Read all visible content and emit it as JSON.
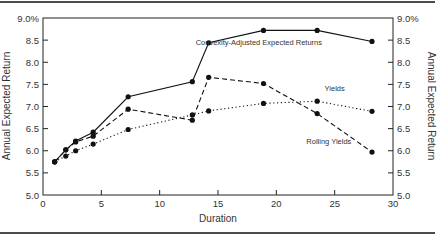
{
  "chart_data": {
    "type": "line",
    "title": "",
    "xlabel": "Duration",
    "ylabel": "Annual Expected Return",
    "ylabel_right": "Annual Expected Return",
    "xlim": [
      0,
      30
    ],
    "ylim": [
      5.0,
      9.0
    ],
    "x_ticks": [
      "0",
      "5",
      "10",
      "15",
      "20",
      "25",
      "30"
    ],
    "y_ticks": [
      "5.0",
      "5.5",
      "6.0",
      "6.5",
      "7.0",
      "7.5",
      "8.0",
      "8.5",
      "9.0%"
    ],
    "grid": false,
    "legend": "inline annotations",
    "series": [
      {
        "name": "Convexity-Adjusted Expected Returns",
        "style": "solid",
        "x": [
          1.0,
          1.95,
          2.8,
          4.3,
          7.3,
          12.8,
          14.2,
          18.9,
          23.5,
          28.2
        ],
        "y": [
          5.75,
          6.02,
          6.22,
          6.42,
          7.22,
          7.56,
          8.44,
          8.72,
          8.72,
          8.47
        ]
      },
      {
        "name": "Rolling Yields",
        "style": "dashed",
        "x": [
          1.0,
          1.95,
          2.8,
          4.3,
          7.3,
          12.8,
          14.2,
          18.9,
          23.5,
          28.2
        ],
        "y": [
          5.75,
          6.02,
          6.2,
          6.33,
          6.94,
          6.69,
          7.66,
          7.52,
          6.84,
          5.97
        ]
      },
      {
        "name": "Yields",
        "style": "dotted",
        "x": [
          1.0,
          1.95,
          2.8,
          4.3,
          7.3,
          12.8,
          14.2,
          18.9,
          23.5,
          28.2
        ],
        "y": [
          5.75,
          5.88,
          6.0,
          6.15,
          6.48,
          6.81,
          6.9,
          7.07,
          7.12,
          6.89
        ]
      }
    ],
    "annotations": [
      {
        "text": "Convexity-Adjusted Expected Returns",
        "x": 18.5,
        "y": 8.4
      },
      {
        "text": "Yields",
        "x": 25.0,
        "y": 7.35
      },
      {
        "text": "Rolling Yields",
        "x": 24.5,
        "y": 6.15
      }
    ]
  }
}
